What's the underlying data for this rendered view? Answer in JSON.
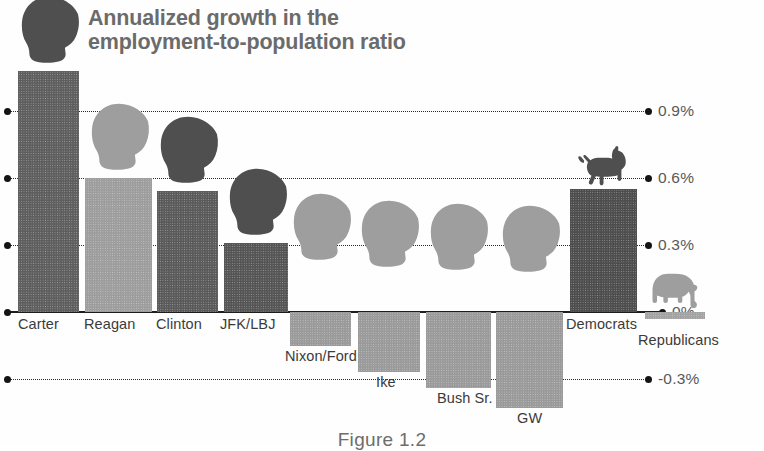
{
  "chart_data": {
    "type": "bar",
    "title": "Annualized growth in the employment-to-population ratio",
    "title_line1": "Annualized growth in the",
    "title_line2": "employment-to-population ratio",
    "xlabel": "",
    "ylabel": "",
    "ylim": [
      -0.45,
      1.15
    ],
    "grid": true,
    "legend": "none",
    "axis_side": "right",
    "unit": "%",
    "ticks": [
      {
        "value": 0.9,
        "label": "0.9%"
      },
      {
        "value": 0.6,
        "label": "0.6%"
      },
      {
        "value": 0.3,
        "label": "0.3%"
      },
      {
        "value": 0.0,
        "label": "0%"
      },
      {
        "value": -0.3,
        "label": "-0.3%"
      }
    ],
    "categories": [
      "Carter",
      "Reagan",
      "Clinton",
      "JFK/LBJ",
      "Nixon/Ford",
      "Ike",
      "Bush Sr.",
      "GW",
      "Democrats",
      "Republicans"
    ],
    "values": [
      1.08,
      0.6,
      0.54,
      0.31,
      -0.15,
      -0.27,
      -0.34,
      -0.43,
      0.55,
      -0.03
    ],
    "bars": [
      {
        "label": "Carter",
        "value": 1.08,
        "icon": "president-head-icon",
        "shade": "dark",
        "color": "#5e5e5e"
      },
      {
        "label": "Reagan",
        "value": 0.6,
        "icon": "president-head-icon",
        "shade": "light",
        "color": "#9d9d9d"
      },
      {
        "label": "Clinton",
        "value": 0.54,
        "icon": "president-head-icon",
        "shade": "dark",
        "color": "#5a5a5a"
      },
      {
        "label": "JFK/LBJ",
        "value": 0.31,
        "icon": "president-head-icon",
        "shade": "dark",
        "color": "#555555"
      },
      {
        "label": "Nixon/Ford",
        "value": -0.15,
        "icon": "president-head-icon",
        "shade": "light",
        "color": "#9a9a9a"
      },
      {
        "label": "Ike",
        "value": -0.27,
        "icon": "president-head-icon",
        "shade": "light",
        "color": "#9a9a9a"
      },
      {
        "label": "Bush Sr.",
        "value": -0.34,
        "icon": "president-head-icon",
        "shade": "light",
        "color": "#9a9a9a"
      },
      {
        "label": "GW",
        "value": -0.43,
        "icon": "president-head-icon",
        "shade": "light",
        "color": "#9a9a9a"
      },
      {
        "label": "Democrats",
        "value": 0.55,
        "icon": "donkey-icon",
        "shade": "dark",
        "color": "#4d4d4d"
      },
      {
        "label": "Republicans",
        "value": -0.03,
        "icon": "elephant-icon",
        "shade": "light",
        "color": "#a2a2a2"
      }
    ]
  },
  "caption": "Figure 1.2",
  "colors": {
    "bar_dark": "#5a5a5a",
    "bar_light": "#9a9a9a",
    "title": "#6b6b6b",
    "axis_text": "#585858",
    "gridline": "#2b2b2b",
    "zero_line": "#1d1d1d",
    "background": "#ffffff"
  }
}
